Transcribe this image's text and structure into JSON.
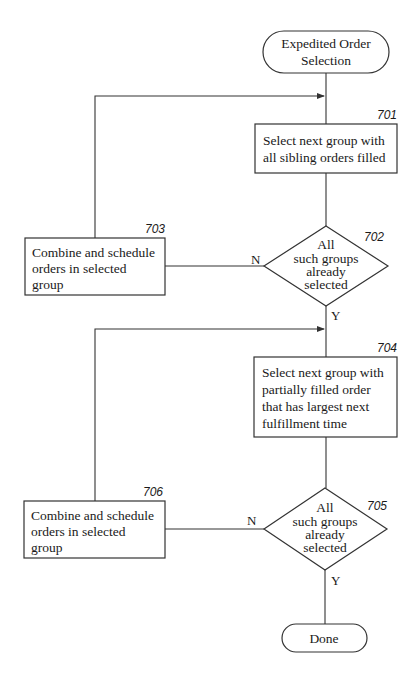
{
  "diagram": {
    "type": "flowchart",
    "nodes": {
      "start": {
        "kind": "terminal",
        "lines": [
          "Expedited Order",
          "Selection"
        ]
      },
      "n701": {
        "kind": "process",
        "ref": "701",
        "lines": [
          "Select next group with",
          "all sibling orders filled"
        ]
      },
      "n702": {
        "kind": "decision",
        "ref": "702",
        "lines": [
          "All",
          "such groups",
          "already",
          "selected"
        ]
      },
      "n703": {
        "kind": "process",
        "ref": "703",
        "lines": [
          "Combine and schedule",
          "orders in selected",
          "group"
        ]
      },
      "n704": {
        "kind": "process",
        "ref": "704",
        "lines": [
          "Select next group with",
          "partially filled order",
          "that has largest next",
          "fulfillment time"
        ]
      },
      "n705": {
        "kind": "decision",
        "ref": "705",
        "lines": [
          "All",
          "such groups",
          "already",
          "selected"
        ]
      },
      "n706": {
        "kind": "process",
        "ref": "706",
        "lines": [
          "Combine and schedule",
          "orders in selected",
          "group"
        ]
      },
      "done": {
        "kind": "terminal",
        "lines": [
          "Done"
        ]
      }
    },
    "edges": [
      {
        "from": "start",
        "to": "n701",
        "label": ""
      },
      {
        "from": "n701",
        "to": "n702",
        "label": ""
      },
      {
        "from": "n702",
        "to": "n703",
        "label": "N"
      },
      {
        "from": "n703",
        "to": "n701",
        "label": ""
      },
      {
        "from": "n702",
        "to": "n704",
        "label": "Y"
      },
      {
        "from": "n704",
        "to": "n705",
        "label": ""
      },
      {
        "from": "n705",
        "to": "n706",
        "label": "N"
      },
      {
        "from": "n706",
        "to": "n704",
        "label": ""
      },
      {
        "from": "n705",
        "to": "done",
        "label": "Y"
      }
    ],
    "labels": {
      "n702_no": "N",
      "n702_yes": "Y",
      "n705_no": "N",
      "n705_yes": "Y"
    }
  }
}
